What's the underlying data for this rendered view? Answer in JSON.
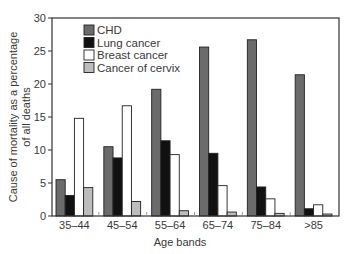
{
  "chart_data": {
    "type": "bar",
    "title": "",
    "xlabel": "Age bands",
    "ylabel": "Cause of mortality as a percentage of all deaths",
    "ylabel_lines": [
      "Cause of mortality as a percentage",
      "of all deaths"
    ],
    "ylim": [
      0,
      30
    ],
    "yticks": [
      0,
      5,
      10,
      15,
      20,
      25,
      30
    ],
    "grid": false,
    "legend_position": "upper-left",
    "categories": [
      "35–44",
      "45–54",
      "55–64",
      "65–74",
      "75–84",
      ">85"
    ],
    "series": [
      {
        "name": "CHD",
        "color": "#6b6b6b",
        "values": [
          5.5,
          10.5,
          19.2,
          25.6,
          26.7,
          21.4
        ]
      },
      {
        "name": "Lung cancer",
        "color": "#111111",
        "values": [
          3.1,
          8.8,
          11.4,
          9.5,
          4.4,
          1.1
        ]
      },
      {
        "name": "Breast cancer",
        "color": "#ffffff",
        "values": [
          14.8,
          16.7,
          9.3,
          4.6,
          2.6,
          1.7
        ]
      },
      {
        "name": "Cancer of cervix",
        "color": "#bdbdbd",
        "values": [
          4.3,
          2.2,
          0.8,
          0.6,
          0.4,
          0.3
        ]
      }
    ]
  }
}
